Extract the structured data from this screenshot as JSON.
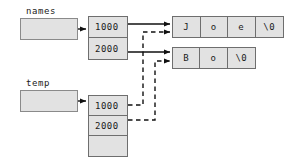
{
  "diagram": {
    "colors": {
      "fill": "#e2e2e2",
      "stroke": "#6e6e6e",
      "line": "#111111",
      "text": "#1a1a1a",
      "background": "#ffffff"
    },
    "variables": [
      {
        "name": "names",
        "label": "names"
      },
      {
        "name": "temp",
        "label": "temp"
      }
    ],
    "names_array": {
      "label": "names",
      "cells": [
        {
          "value": "1000"
        },
        {
          "value": "2000"
        }
      ]
    },
    "temp_array": {
      "label": "temp",
      "cells": [
        {
          "value": "1000"
        },
        {
          "value": "2000"
        },
        {
          "value": ""
        }
      ]
    },
    "strings": [
      {
        "address": "1000",
        "text": "Joe",
        "chars": [
          "J",
          "o",
          "e",
          "\\0"
        ]
      },
      {
        "address": "2000",
        "text": "Bo",
        "chars": [
          "B",
          "o",
          "\\0"
        ]
      }
    ],
    "edges": {
      "solid": [
        {
          "from": "names-variable",
          "to": "names-array"
        },
        {
          "from": "names-cell-0",
          "to": "string-joe"
        },
        {
          "from": "names-cell-1",
          "to": "string-bo"
        },
        {
          "from": "temp-variable",
          "to": "temp-array"
        }
      ],
      "dashed": [
        {
          "from": "temp-cell-0",
          "to": "string-joe"
        },
        {
          "from": "temp-cell-1",
          "to": "string-bo"
        }
      ]
    }
  }
}
